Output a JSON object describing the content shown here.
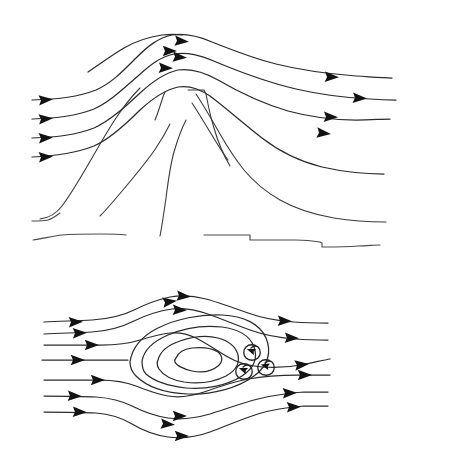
{
  "figure": {
    "title": "Airflow over an isolated mountain and around a blocking vortex",
    "background_color": "#ffffff",
    "line_color": "#2b2b2b",
    "arrow_color": "#131313",
    "width": 452,
    "height": 461,
    "panels": [
      {
        "id": "upper-panel",
        "name": "mountain-cross-section",
        "description": "Side view: streamlines deflected up and over a mountain ridge",
        "streamline_count": 5,
        "arrow_count": 12
      },
      {
        "id": "lower-panel",
        "name": "vortex-plan-view",
        "description": "Plan view: streamlines splitting around closed elliptical contours with three small lee eddies",
        "streamline_count": 7,
        "closed_contour_count": 4,
        "eddy_count": 3,
        "arrow_count": 19
      }
    ]
  },
  "upper_panel": {
    "streamlines": [
      {
        "name": "streamline-1",
        "path": "M 32,100 C 60,99 78,97 96,90 C 112,83 124,70 136,58 C 148,46 158,38 172,35 C 186,33 198,36 212,42 C 232,50 252,58 276,64 C 300,70 330,74 356,76 C 372,77 382,78 392,78"
      },
      {
        "name": "streamline-2",
        "path": "M 32,119 C 58,118 76,116 94,109 C 110,102 124,88 138,76 C 150,65 160,57 174,54 C 188,52 200,55 216,62 C 240,72 266,82 296,89 C 322,95 350,98 370,99 C 382,100 390,100 396,100"
      },
      {
        "name": "streamline-3",
        "path": "M 32,138 C 58,137 76,135 94,128 C 110,121 126,106 140,93 C 152,82 164,73 178,70 C 192,68 204,72 218,80 C 242,94 264,104 288,111 C 310,117 336,120 356,120 C 370,120 382,119 390,119"
      },
      {
        "name": "streamline-4",
        "path": "M 32,157 C 58,156 76,153 94,146 C 110,139 126,124 140,110 C 152,99 164,90 178,87 C 190,85 200,89 210,96 C 226,108 244,124 262,138 C 280,152 302,162 322,167 C 344,172 368,174 384,174"
      },
      {
        "name": "streamline-5",
        "path": "M 88,72 C 100,64 112,55 124,48 C 136,41 148,37 162,35 C 170,34 176,34 182,35"
      }
    ],
    "arrows_left": [
      {
        "x": 44,
        "y": 100,
        "angle": -4
      },
      {
        "x": 44,
        "y": 119,
        "angle": -4
      },
      {
        "x": 44,
        "y": 138,
        "angle": -3
      },
      {
        "x": 44,
        "y": 157,
        "angle": -3
      }
    ],
    "arrows_crest": [
      {
        "x": 180,
        "y": 41,
        "angle": 4
      },
      {
        "x": 168,
        "y": 51,
        "angle": 0
      },
      {
        "x": 178,
        "y": 57,
        "angle": 4
      },
      {
        "x": 164,
        "y": 68,
        "angle": 2
      }
    ],
    "arrows_right": [
      {
        "x": 330,
        "y": 77,
        "angle": 2
      },
      {
        "x": 358,
        "y": 98,
        "angle": 3
      },
      {
        "x": 329,
        "y": 117,
        "angle": 2
      },
      {
        "x": 322,
        "y": 133,
        "angle": 6
      }
    ],
    "terrain": [
      {
        "name": "mountain-left-flank",
        "path": "M 40,219 C 48,218 56,214 62,206 C 72,193 82,175 92,158 C 100,144 108,130 116,118 C 124,106 132,96 140,88"
      },
      {
        "name": "mountain-left-inner-ridge",
        "path": "M 100,216 C 108,208 118,196 128,184 C 138,172 148,160 156,148 C 162,139 166,132 170,124"
      },
      {
        "name": "mountain-summit-notch",
        "path": "M 155,120 C 158,113 160,106 162,100 C 163,96 164,94 165,92"
      },
      {
        "name": "mountain-central-gully",
        "path": "M 160,236 C 162,226 164,212 166,198 C 168,182 170,166 174,152 C 178,138 182,128 186,120"
      },
      {
        "name": "mountain-peak-shoulder",
        "path": "M 188,90 L 204,90 L 206,94 C 208,104 210,116 214,128 C 218,142 224,156 230,166"
      },
      {
        "name": "mountain-right-ridge",
        "path": "M 192,103 C 198,112 204,122 210,132 C 216,142 222,152 228,160"
      },
      {
        "name": "mountain-right-flank",
        "path": "M 196,94 C 204,106 212,120 220,134 C 228,148 236,160 244,170 C 254,182 266,192 280,200 C 296,209 316,215 334,218 C 352,221 372,222 386,222"
      }
    ],
    "ground_lines": [
      {
        "name": "ground-left-upper",
        "path": "M 32,221 C 38,221 44,221 48,220 C 52,219 56,216 60,213"
      },
      {
        "name": "ground-left-lower",
        "path": "M 33,240 C 42,239 52,236 62,235 C 74,234 88,234 100,234 C 110,234 118,234 126,235"
      },
      {
        "name": "ground-right-lower",
        "path": "M 204,235 C 220,235 234,235 248,235 L 250,235 L 250,240 C 262,240 280,240 296,240 C 306,240 314,241 320,242 L 322,243 L 322,247 C 334,247 346,247 358,246 C 366,246 374,245 380,245"
      }
    ]
  },
  "lower_panel": {
    "streamlines": [
      {
        "name": "streamline-1",
        "path": "M 44,322 C 60,321 76,321 92,320 C 108,319 122,316 134,310 C 146,304 156,300 170,297 C 182,295 194,296 206,299 C 220,303 234,308 248,313 C 262,318 278,321 294,322 C 308,323 320,323 328,323"
      },
      {
        "name": "streamline-2",
        "path": "M 44,334 C 60,333 76,333 92,332 C 108,331 122,327 134,321 C 146,315 158,311 172,309 C 184,308 196,310 208,314 C 222,319 236,325 250,330 C 264,335 280,338 296,339 C 308,340 320,340 328,340"
      },
      {
        "name": "streamline-3",
        "path": "M 44,345 C 62,345 82,345 100,345 C 116,345 128,344 140,340 C 150,337 160,334 170,333 C 180,332 188,334 196,338 C 206,343 216,350 226,356 C 236,362 248,366 262,367 C 276,368 292,367 306,364 C 316,362 324,360 330,359"
      },
      {
        "name": "streamline-4-stagnation",
        "path": "M 42,360 C 62,360 84,360 104,360 C 116,360 124,360 128,360"
      },
      {
        "name": "streamline-5",
        "path": "M 44,380 C 62,380 82,380 100,380 C 114,380 126,382 136,386 C 146,390 156,394 168,396 C 180,398 192,396 204,392 C 218,387 232,382 248,379 C 264,376 282,375 298,375 C 310,375 322,375 330,375"
      },
      {
        "name": "streamline-6",
        "path": "M 44,396 C 62,396 80,396 96,397 C 110,398 122,401 132,406 C 142,411 154,416 168,418 C 182,420 196,418 210,414 C 226,409 242,403 258,399 C 274,395 290,393 304,392 C 314,392 322,392 328,392"
      },
      {
        "name": "streamline-7",
        "path": "M 44,412 C 62,412 80,412 96,413 C 110,414 122,418 132,424 C 142,430 154,435 168,437 C 182,439 196,437 210,432 C 226,426 242,419 258,414 C 274,409 290,407 304,406 C 314,406 322,406 328,406"
      }
    ],
    "closed_contours": [
      {
        "name": "contour-outer",
        "path": "M 130,362 C 132,348 142,336 158,328 C 176,319 200,314 222,315 C 244,316 260,324 266,338 C 272,352 268,366 254,376 C 238,388 212,395 188,394 C 164,393 146,386 136,376 C 131,371 130,366 130,362 Z"
      },
      {
        "name": "contour-second",
        "path": "M 142,361 C 144,350 154,341 168,335 C 184,328 204,325 222,327 C 238,329 250,336 254,347 C 258,358 254,368 242,376 C 228,385 206,390 186,388 C 168,386 154,381 146,374 C 142,370 142,365 142,361 Z"
      },
      {
        "name": "contour-third",
        "path": "M 158,360 C 160,352 168,345 180,341 C 192,337 206,335 218,338 C 229,341 236,347 238,355 C 240,364 235,371 226,376 C 214,382 198,384 184,382 C 172,380 163,375 159,369 C 157,366 157,362 158,360 Z"
      },
      {
        "name": "contour-inner",
        "path": "M 176,358 C 178,353 184,349 192,348 C 202,347 212,348 218,352 C 223,356 223,362 218,366 C 212,371 202,373 192,371 C 183,369 176,365 175,362 C 174,360 175,359 176,358 Z"
      }
    ],
    "eddies": [
      {
        "name": "eddy-upper",
        "spiral": "M 258,347 C 254,344 249,344 246,347 C 243,350 243,355 246,358 C 249,361 255,361 258,358 C 261,355 261,350 258,347 C 256,346 253,346 251,348",
        "arrow": {
          "x": 252,
          "y": 351,
          "angle": 200
        }
      },
      {
        "name": "eddy-lower-left",
        "spiral": "M 250,366 C 246,363 241,363 238,366 C 235,369 235,374 238,377 C 241,380 247,380 250,377 C 253,374 253,369 250,366 C 248,365 245,365 243,367",
        "arrow": {
          "x": 244,
          "y": 370,
          "angle": 200
        }
      },
      {
        "name": "eddy-lower-right",
        "spiral": "M 272,362 C 268,359 263,359 260,362 C 257,365 257,370 260,373 C 263,376 269,376 272,373 C 275,370 275,365 272,362 C 270,361 267,361 265,363",
        "arrow": {
          "x": 266,
          "y": 366,
          "angle": 195
        }
      }
    ],
    "arrows_left": [
      {
        "x": 74,
        "y": 322,
        "angle": -2
      },
      {
        "x": 78,
        "y": 333,
        "angle": -2
      },
      {
        "x": 90,
        "y": 345,
        "angle": 0
      },
      {
        "x": 76,
        "y": 360,
        "angle": 0
      },
      {
        "x": 96,
        "y": 380,
        "angle": 0
      },
      {
        "x": 73,
        "y": 396,
        "angle": 2
      },
      {
        "x": 78,
        "y": 412,
        "angle": 2
      }
    ],
    "arrows_top": [
      {
        "x": 182,
        "y": 296,
        "angle": 4
      },
      {
        "x": 168,
        "y": 302,
        "angle": -8
      },
      {
        "x": 178,
        "y": 310,
        "angle": 2
      }
    ],
    "arrows_bottom": [
      {
        "x": 178,
        "y": 416,
        "angle": 0
      },
      {
        "x": 166,
        "y": 424,
        "angle": 4
      },
      {
        "x": 180,
        "y": 436,
        "angle": 0
      }
    ],
    "arrows_right": [
      {
        "x": 283,
        "y": 321,
        "angle": 2
      },
      {
        "x": 290,
        "y": 338,
        "angle": 2
      },
      {
        "x": 300,
        "y": 365,
        "angle": -6
      },
      {
        "x": 303,
        "y": 375,
        "angle": 0
      },
      {
        "x": 288,
        "y": 393,
        "angle": -2
      },
      {
        "x": 292,
        "y": 407,
        "angle": -2
      }
    ]
  }
}
